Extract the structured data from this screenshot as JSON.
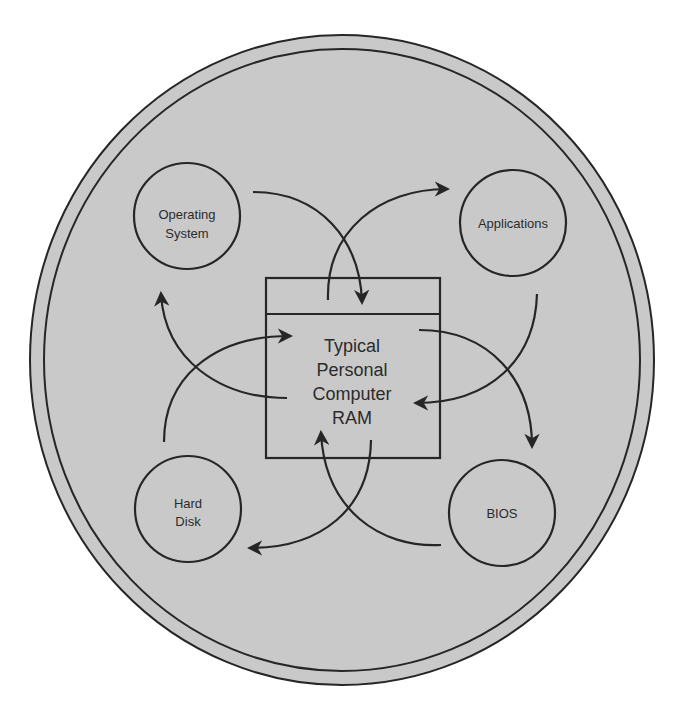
{
  "diagram": {
    "center": {
      "lines": [
        "Typical",
        "Personal",
        "Computer",
        "RAM"
      ]
    },
    "nodes": [
      {
        "id": "os",
        "lines": [
          "Operating",
          "System"
        ]
      },
      {
        "id": "applications",
        "lines": [
          "Applications"
        ]
      },
      {
        "id": "hard-disk",
        "lines": [
          "Hard",
          "Disk"
        ]
      },
      {
        "id": "bios",
        "lines": [
          "BIOS"
        ]
      }
    ],
    "flows": [
      {
        "from": "Operating System",
        "to": "RAM"
      },
      {
        "from": "RAM",
        "to": "Applications"
      },
      {
        "from": "Applications",
        "to": "RAM"
      },
      {
        "from": "RAM",
        "to": "BIOS"
      },
      {
        "from": "BIOS",
        "to": "RAM"
      },
      {
        "from": "RAM",
        "to": "Hard Disk"
      },
      {
        "from": "Hard Disk",
        "to": "RAM"
      },
      {
        "from": "RAM",
        "to": "Operating System"
      }
    ],
    "colors": {
      "fill": "#c8c8c8",
      "stroke": "#262626",
      "background": "#ffffff"
    }
  }
}
